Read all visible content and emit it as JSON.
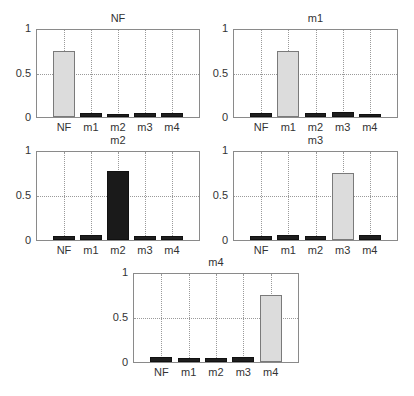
{
  "chart_data": [
    {
      "type": "bar",
      "title": "NF",
      "categories": [
        "NF",
        "m1",
        "m2",
        "m3",
        "m4"
      ],
      "values": [
        0.76,
        0.05,
        0.04,
        0.05,
        0.05
      ],
      "highlight_index": 0,
      "highlight_color": "#dcdcdc",
      "ylim": [
        0,
        1
      ],
      "yticks": [
        "0",
        "0.5",
        "1"
      ],
      "grid": true
    },
    {
      "type": "bar",
      "title": "m1",
      "categories": [
        "NF",
        "m1",
        "m2",
        "m3",
        "m4"
      ],
      "values": [
        0.05,
        0.76,
        0.05,
        0.06,
        0.04
      ],
      "highlight_index": 1,
      "highlight_color": "#dcdcdc",
      "ylim": [
        0,
        1
      ],
      "yticks": [
        "0",
        "0.5",
        "1"
      ],
      "grid": true
    },
    {
      "type": "bar",
      "title": "m2",
      "categories": [
        "NF",
        "m1",
        "m2",
        "m3",
        "m4"
      ],
      "values": [
        0.05,
        0.06,
        0.78,
        0.04,
        0.05
      ],
      "highlight_index": 2,
      "highlight_color": "#1a1a1a",
      "ylim": [
        0,
        1
      ],
      "yticks": [
        "0",
        "0.5",
        "1"
      ],
      "grid": true
    },
    {
      "type": "bar",
      "title": "m3",
      "categories": [
        "NF",
        "m1",
        "m2",
        "m3",
        "m4"
      ],
      "values": [
        0.05,
        0.06,
        0.04,
        0.76,
        0.06
      ],
      "highlight_index": 3,
      "highlight_color": "#dcdcdc",
      "ylim": [
        0,
        1
      ],
      "yticks": [
        "0",
        "0.5",
        "1"
      ],
      "grid": true
    },
    {
      "type": "bar",
      "title": "m4",
      "categories": [
        "NF",
        "m1",
        "m2",
        "m3",
        "m4"
      ],
      "values": [
        0.06,
        0.04,
        0.05,
        0.06,
        0.76
      ],
      "highlight_index": 4,
      "highlight_color": "#dcdcdc",
      "ylim": [
        0,
        1
      ],
      "yticks": [
        "0",
        "0.5",
        "1"
      ],
      "grid": true
    }
  ]
}
